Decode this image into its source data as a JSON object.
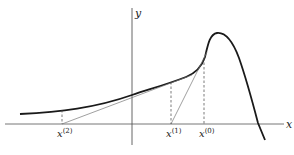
{
  "diagram": {
    "axes": {
      "x_label": "x",
      "y_label": "y"
    },
    "points": [
      {
        "label_base": "x",
        "label_sup": "(2)",
        "x": 62
      },
      {
        "label_base": "x",
        "label_sup": "(1)",
        "x": 171
      },
      {
        "label_base": "x",
        "label_sup": "(0)",
        "x": 204
      }
    ],
    "colors": {
      "curve": "#1a1a1a",
      "axis": "#555555",
      "tangent": "#666666",
      "dashed": "#444444"
    }
  }
}
